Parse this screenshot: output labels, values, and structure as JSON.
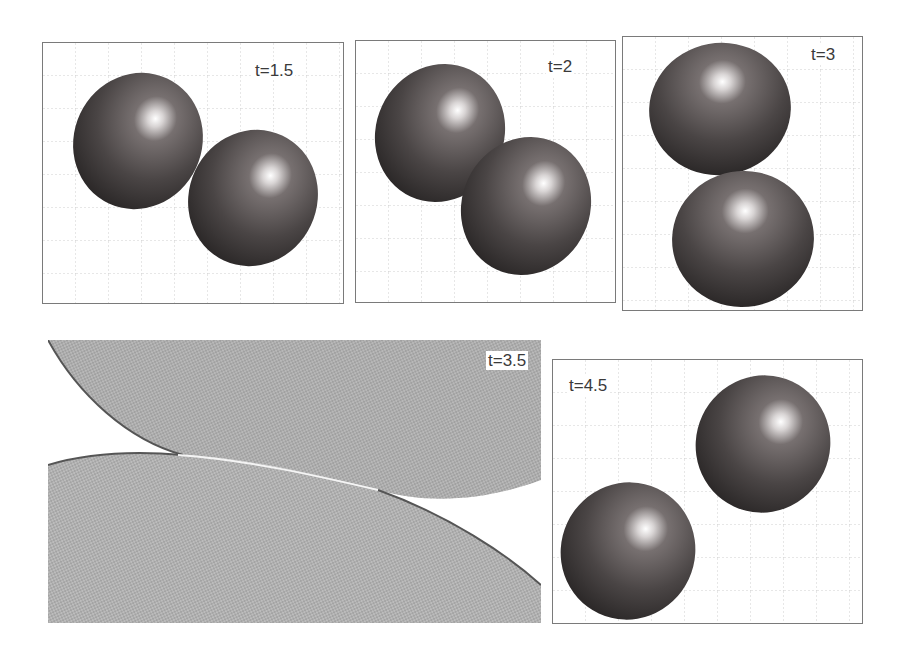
{
  "figure": {
    "panels": [
      {
        "id": "p1",
        "label": "t=1.5",
        "view": "shaded"
      },
      {
        "id": "p2",
        "label": "t=2",
        "view": "shaded"
      },
      {
        "id": "p3",
        "label": "t=3",
        "view": "shaded"
      },
      {
        "id": "p4",
        "label": "t=3.5",
        "view": "mesh-closeup"
      },
      {
        "id": "p5",
        "label": "t=4.5",
        "view": "shaded"
      }
    ]
  },
  "colors": {
    "sphere_dark": "#2e2b2b",
    "sphere_mid": "#5a5454",
    "sphere_highlight": "#ffffff",
    "grid": "#c8c8c8",
    "frame": "#7a7a7a",
    "mesh": "#8a8a8a"
  }
}
